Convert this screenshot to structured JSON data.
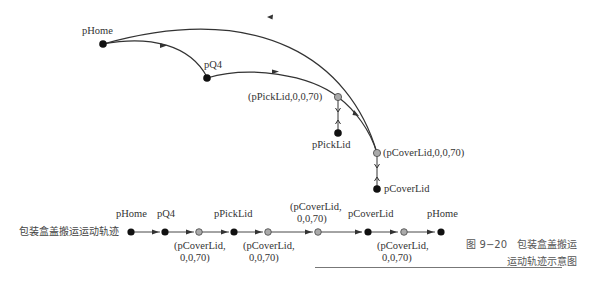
{
  "diagram": {
    "top": {
      "nodes": [
        {
          "id": "pHome",
          "label": "pHome",
          "type": "target"
        },
        {
          "id": "pQ4",
          "label": "pQ4",
          "type": "target"
        },
        {
          "id": "pPickLidOffs",
          "label": "(pPickLid,0,0,70)",
          "type": "offset"
        },
        {
          "id": "pPickLid",
          "label": "pPickLid",
          "type": "target"
        },
        {
          "id": "pCoverLidOffs",
          "label": "(pCoverLid,0,0,70)",
          "type": "offset"
        },
        {
          "id": "pCoverLid",
          "label": "pCoverLid",
          "type": "target"
        }
      ]
    },
    "sequence": {
      "title": "包装盒盖搬运运动轨迹",
      "steps": [
        {
          "label": "pHome",
          "pos": "above",
          "type": "target"
        },
        {
          "label": "pQ4",
          "pos": "above",
          "type": "target"
        },
        {
          "label": "(pCoverLid,",
          "label2": "0,0,70)",
          "pos": "below",
          "type": "offset"
        },
        {
          "label": "pPickLid",
          "pos": "above",
          "type": "target"
        },
        {
          "label": "(pCoverLid,",
          "label2": "0,0,70)",
          "pos": "below",
          "type": "offset"
        },
        {
          "label": "(pCoverLid,",
          "label2": "0,0,70)",
          "pos": "above",
          "type": "offset"
        },
        {
          "label": "pCoverLid",
          "pos": "above",
          "type": "target"
        },
        {
          "label": "(pCoverLid,",
          "label2": "0,0,70)",
          "pos": "below",
          "type": "offset"
        },
        {
          "label": "pHome",
          "pos": "above",
          "type": "target"
        }
      ]
    },
    "caption": {
      "line1": "图 9−20　包装盒盖搬运",
      "line2": "运动轨迹示意图"
    },
    "colors": {
      "target": "#111111",
      "offset": "#aaaaaa",
      "line": "#333333"
    }
  }
}
